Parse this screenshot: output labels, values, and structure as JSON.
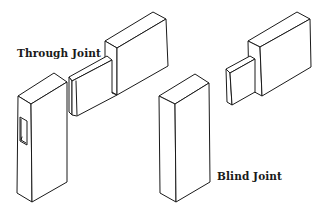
{
  "figure": {
    "labels": {
      "through_joint": "Through Joint",
      "blind_joint": "Blind Joint"
    },
    "stroke_color": "#1a1a1a",
    "background_color": "#ffffff"
  }
}
